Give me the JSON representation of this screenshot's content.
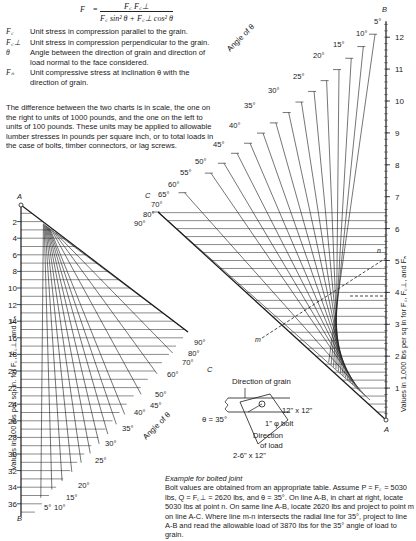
{
  "formula": {
    "lhs": "F",
    "lhs_sub": "n",
    "numerator": "F_c F_c⊥",
    "denominator": "F_c sin²θ + F_c⊥ cos²θ",
    "display_numerator": "F꜀ F꜀⊥",
    "display_denominator": "F꜀ sin² θ + F꜀⊥ cos² θ",
    "equals": "="
  },
  "definitions": [
    {
      "symbol": "F꜀",
      "text": "Unit stress in compression parallel to the grain."
    },
    {
      "symbol": "F꜀⊥",
      "text": "Unit stress in compression perpendicular to the grain."
    },
    {
      "symbol": "θ",
      "text": "Angle between the direction of grain and direction of load normal to the face considered."
    },
    {
      "symbol": "Fₙ",
      "text": "Unit compressive stress at inclination θ with the direction of grain."
    }
  ],
  "paragraph": "The difference between the two charts is in scale, the one on the right to units of 1000 pounds, and the one on the left to units of 100 pounds. These units may be applied to allowable lumber stresses in pounds per square inch, or to total loads in the case of bolts, timber connectors, or lag screws.",
  "right_chart": {
    "axis_label": "Values in 1,000 lbs per sq in for F꜀, F꜀⊥, and Fₙ",
    "ticks": [
      "1",
      "2",
      "3",
      "4",
      "5",
      "6",
      "7",
      "8",
      "9",
      "10",
      "11",
      "12"
    ],
    "point_labels": {
      "A": "A",
      "B": "B",
      "C": "C",
      "n": "n",
      "m": "m"
    },
    "angle_title": "Angle of θ",
    "angle_labels": [
      "5°",
      "10°",
      "15°",
      "20°",
      "25°",
      "30°",
      "35°",
      "40°",
      "45°",
      "50°",
      "55°",
      "60°",
      "65°",
      "70°",
      "80°",
      "90°"
    ]
  },
  "left_chart": {
    "axis_label": "Values in 100 lbs per sq. in. for F꜀, F꜀⊥, and Fₙ",
    "ticks": [
      "2",
      "4",
      "6",
      "8",
      "10",
      "12",
      "14",
      "16",
      "18",
      "20",
      "22",
      "24",
      "26",
      "28",
      "30",
      "32",
      "34",
      "36"
    ],
    "point_labels": {
      "A": "A",
      "B": "B",
      "C": "C"
    },
    "angle_title": "Angle of θ",
    "angle_labels": [
      "5°",
      "10°",
      "15°",
      "20°",
      "25°",
      "30°",
      "35°",
      "40°",
      "45°",
      "50°",
      "60°",
      "70°",
      "80°",
      "90°"
    ]
  },
  "joint_diagram": {
    "grain_label": "Direction of grain",
    "theta_label": "θ = 35°",
    "member_label": "12\" x 12\"",
    "bolt_label": "1\" φ bolt",
    "load_label": "Direction of load",
    "side_label": "2-6\" x 12\""
  },
  "example": {
    "heading": "Example for bolted joint",
    "body": "Bolt values are obtained from an appropriate table. Assume P = F꜀ = 5030 lbs, Q = F꜀⊥ = 2620 lbs, and θ = 35°. On line A-B, in chart at right, locate 5030 lbs at point n. On same line A-B, locate 2620 lbs and project to point m on line A-C. Where line m-n intersects the radial line for 35°, project to line A-B and read the allowable load of 3870 lbs for the 35° angle of load to grain."
  }
}
